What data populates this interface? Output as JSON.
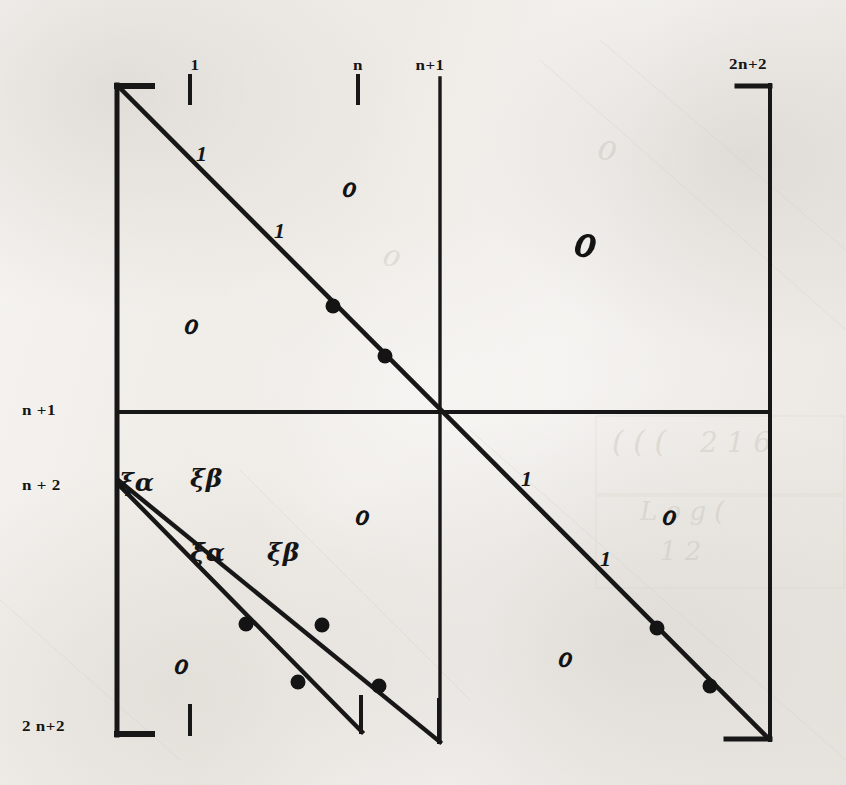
{
  "figure": {
    "kind": "handwritten-block-matrix-diagram",
    "width": 846,
    "height": 785,
    "ink_color": "#171717",
    "paper_color": "#f2f0ed"
  },
  "column_labels": [
    {
      "id": "col-1",
      "text": "1",
      "x": 195,
      "y": 57,
      "tick": {
        "x": 190,
        "y": 76,
        "length": 26
      }
    },
    {
      "id": "col-n",
      "text": "n",
      "x": 358,
      "y": 57,
      "tick": {
        "x": 358,
        "y": 76,
        "length": 26
      }
    },
    {
      "id": "col-n1",
      "text": "n+1",
      "x": 430,
      "y": 57,
      "tick": null
    },
    {
      "id": "col-2n2",
      "text": "2n+2",
      "x": 748,
      "y": 56,
      "tick": null
    }
  ],
  "row_labels": [
    {
      "id": "row-n1",
      "text": "n +1",
      "x": 22,
      "y": 402
    },
    {
      "id": "row-n2",
      "text": "n + 2",
      "x": 22,
      "y": 477
    },
    {
      "id": "row-2n2",
      "text": "2 n+2",
      "x": 22,
      "y": 718
    }
  ],
  "diagonal_entries": [
    {
      "id": "entry-1-a",
      "text": "1",
      "x": 196,
      "y": 143
    },
    {
      "id": "entry-1-b",
      "text": "1",
      "x": 274,
      "y": 220
    },
    {
      "id": "entry-1-c",
      "text": "1",
      "x": 521,
      "y": 468
    },
    {
      "id": "entry-1-d",
      "text": "1",
      "x": 600,
      "y": 548
    }
  ],
  "greek_entries": [
    {
      "id": "xi-alpha-upper",
      "text": "ξα",
      "x": 119,
      "y": 470
    },
    {
      "id": "xi-beta-upper",
      "text": "ξβ",
      "x": 190,
      "y": 466
    },
    {
      "id": "xi-alpha-lower",
      "text": "ξα",
      "x": 190,
      "y": 540
    },
    {
      "id": "xi-beta-lower",
      "text": "ξβ",
      "x": 267,
      "y": 540
    }
  ],
  "bigo_entries": [
    {
      "id": "bigo-top-mid",
      "text": "ℴ",
      "x": 340,
      "y": 168,
      "size": "small"
    },
    {
      "id": "bigo-left-upper",
      "text": "ℴ",
      "x": 182,
      "y": 305,
      "size": "small"
    },
    {
      "id": "bigo-top-right",
      "text": "ℴ",
      "x": 570,
      "y": 212,
      "size": "large"
    },
    {
      "id": "bigo-mid-low",
      "text": "ℴ",
      "x": 353,
      "y": 496,
      "size": "small"
    },
    {
      "id": "bigo-right-mid",
      "text": "ℴ",
      "x": 660,
      "y": 496,
      "size": "small"
    },
    {
      "id": "bigo-bot-left",
      "text": "ℴ",
      "x": 172,
      "y": 645,
      "size": "small"
    },
    {
      "id": "bigo-bot-right",
      "text": "ℴ",
      "x": 556,
      "y": 638,
      "size": "small"
    }
  ],
  "lines": {
    "frame_left": {
      "x1": 117,
      "y1": 85,
      "x2": 117,
      "y2": 735
    },
    "bracket_top_left": {
      "x1": 117,
      "y1": 86,
      "x2": 152,
      "y2": 86
    },
    "bracket_bot_left": {
      "x1": 117,
      "y1": 734,
      "x2": 152,
      "y2": 734
    },
    "frame_right": {
      "x1": 770,
      "y1": 85,
      "x2": 770,
      "y2": 740
    },
    "bracket_top_right": {
      "x1": 737,
      "y1": 86,
      "x2": 770,
      "y2": 86
    },
    "bracket_bot_right": {
      "x1": 726,
      "y1": 739,
      "x2": 770,
      "y2": 739
    },
    "divider_horizontal": {
      "x1": 117,
      "y1": 412,
      "x2": 770,
      "y2": 412
    },
    "divider_vertical": {
      "x1": 440,
      "y1": 78,
      "x2": 440,
      "y2": 742
    },
    "tick_col_1": {
      "x1": 190,
      "y1": 76,
      "x2": 190,
      "y2": 103
    },
    "tick_col_n": {
      "x1": 358,
      "y1": 76,
      "x2": 358,
      "y2": 103
    },
    "tick_bottom_1": {
      "x1": 190,
      "y1": 706,
      "x2": 190,
      "y2": 734
    },
    "main_diagonal": {
      "x1": 120,
      "y1": 88,
      "x2": 766,
      "y2": 736
    },
    "sub_diagonal_1": {
      "x1": 118,
      "y1": 480,
      "x2": 440,
      "y2": 742
    },
    "sub_diagonal_2": {
      "x1": 118,
      "y1": 484,
      "x2": 362,
      "y2": 732
    },
    "sub_diag_1_foot": {
      "x1": 439,
      "y1": 700,
      "x2": 439,
      "y2": 742
    },
    "sub_diag_2_foot": {
      "x1": 361,
      "y1": 697,
      "x2": 361,
      "y2": 732
    }
  },
  "dots": [
    {
      "id": "dot-main-1",
      "cx": 333,
      "cy": 306
    },
    {
      "id": "dot-main-2",
      "cx": 385,
      "cy": 356
    },
    {
      "id": "dot-main-3",
      "cx": 657,
      "cy": 628
    },
    {
      "id": "dot-main-4",
      "cx": 710,
      "cy": 686
    },
    {
      "id": "dot-sub1-1",
      "cx": 322,
      "cy": 625
    },
    {
      "id": "dot-sub1-2",
      "cx": 379,
      "cy": 686
    },
    {
      "id": "dot-sub2-1",
      "cx": 246,
      "cy": 624
    },
    {
      "id": "dot-sub2-2",
      "cx": 298,
      "cy": 682
    }
  ],
  "bleed_through_ghosts": [
    {
      "id": "ghost-a",
      "text": "ℴ",
      "x": 595,
      "y": 160,
      "size": 46,
      "rot": -3
    },
    {
      "id": "ghost-b",
      "text": "( ( (",
      "x": 612,
      "y": 452,
      "size": 30,
      "rot": 0
    },
    {
      "id": "ghost-c",
      "text": "2 1 6",
      "x": 700,
      "y": 452,
      "size": 28,
      "rot": 0
    },
    {
      "id": "ghost-d",
      "text": "ℴ",
      "x": 380,
      "y": 265,
      "size": 40,
      "rot": 4
    },
    {
      "id": "ghost-e",
      "text": "L o g (",
      "x": 640,
      "y": 520,
      "size": 26,
      "rot": 0
    },
    {
      "id": "ghost-f",
      "text": "1 2",
      "x": 660,
      "y": 560,
      "size": 26,
      "rot": 0
    }
  ]
}
